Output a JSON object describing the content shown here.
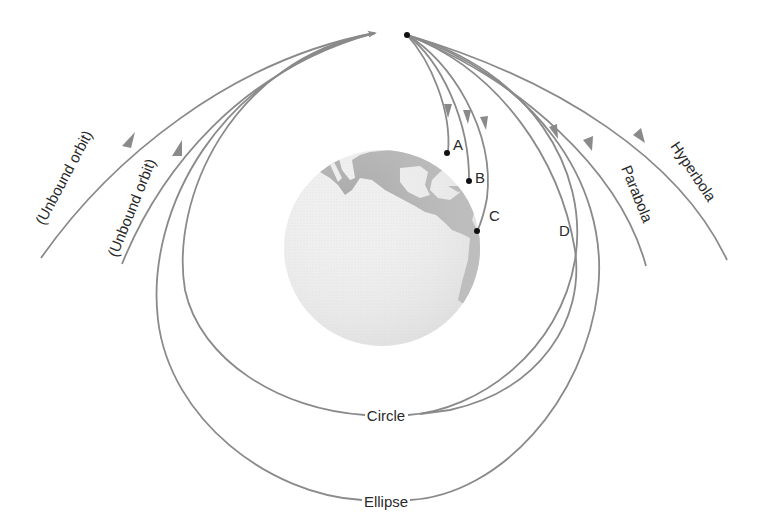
{
  "diagram": {
    "colors": {
      "orbit_stroke": "#8a8a8a",
      "land": "#a9a9a9",
      "ocean": "#ececec",
      "point": "#111111",
      "text": "#2a2a2a"
    },
    "launch_point": {
      "x": 407,
      "y": 35
    },
    "earth": {
      "cx": 382,
      "cy": 248,
      "r": 98
    },
    "labels": {
      "unbound_outer": "(Unbound orbit)",
      "unbound_inner": "(Unbound orbit)",
      "point_a": "A",
      "point_b": "B",
      "point_c": "C",
      "point_d": "D",
      "parabola": "Parabola",
      "hyperbola": "Hyperbola",
      "circle": "Circle",
      "ellipse": "Ellipse"
    },
    "trajectories": [
      {
        "name": "A",
        "type": "suborbital",
        "ends_at": "A"
      },
      {
        "name": "B",
        "type": "suborbital",
        "ends_at": "B"
      },
      {
        "name": "C",
        "type": "suborbital",
        "ends_at": "C"
      },
      {
        "name": "D",
        "type": "suborbital"
      },
      {
        "name": "Circle",
        "type": "closed orbit"
      },
      {
        "name": "Ellipse",
        "type": "closed orbit"
      },
      {
        "name": "Parabola",
        "type": "escape"
      },
      {
        "name": "Hyperbola",
        "type": "escape"
      }
    ]
  }
}
